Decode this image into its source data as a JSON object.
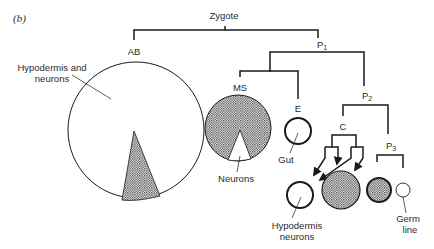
{
  "panel_label": "(b)",
  "lineage": {
    "root": "Zygote",
    "nodes": {
      "ab": "AB",
      "p1": "P",
      "p1_sub": "1",
      "ms": "MS",
      "e": "E",
      "p2": "P",
      "p2_sub": "2",
      "c": "C",
      "p3": "P",
      "p3_sub": "3"
    }
  },
  "annotations": {
    "ab_fate_line1": "Hypodermis and",
    "ab_fate_line2": "neurons",
    "ms_fate": "Neurons",
    "e_fate": "Gut",
    "c_fate_line1": "Hypodermis",
    "c_fate_line2": "neurons",
    "p3_fate_line1": "Germ",
    "p3_fate_line2": "line"
  },
  "colors": {
    "ink": "#1a1a1a",
    "text": "#2a2a2a",
    "background": "#ffffff"
  }
}
